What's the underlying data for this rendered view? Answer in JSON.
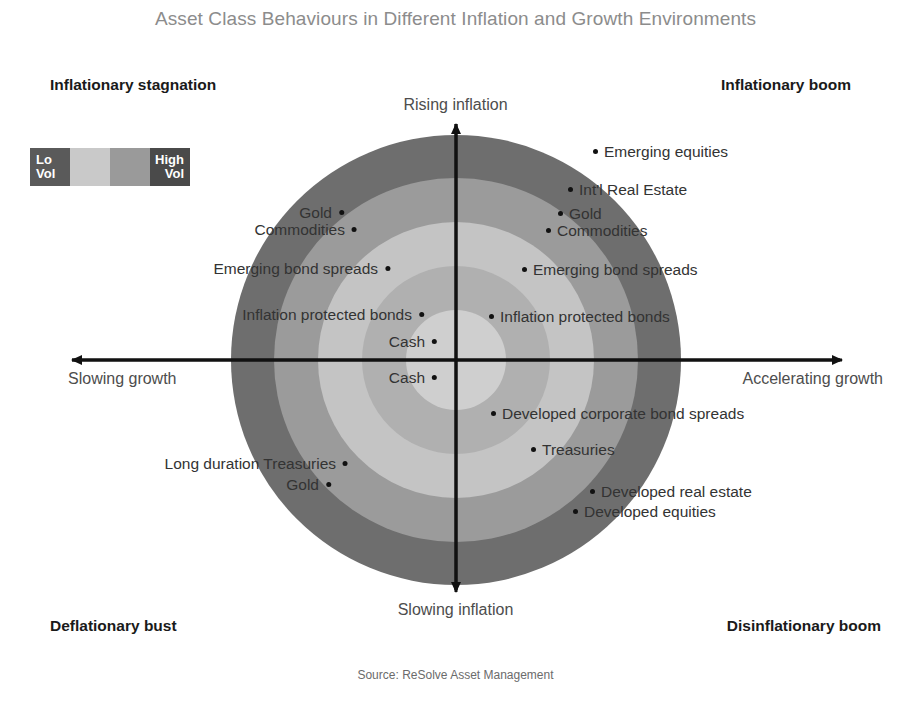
{
  "title": "Asset Class Behaviours in Different Inflation and Growth Environments",
  "source": "Source: ReSolve Asset Management",
  "quadrants": {
    "top_left": "Inflationary stagnation",
    "top_right": "Inflationary boom",
    "bottom_left": "Deflationary bust",
    "bottom_right": "Disinflationary boom"
  },
  "axes": {
    "top": "Rising inflation",
    "bottom": "Slowing inflation",
    "left": "Slowing growth",
    "right": "Accelerating growth"
  },
  "legend": {
    "low_label": "Lo\nVol",
    "low_label_line1": "Lo",
    "low_label_line2": "Vol",
    "high_label_line1": "High",
    "high_label_line2": "Vol",
    "bands": [
      "#5a5a5a",
      "#c9c9c9",
      "#9a9a9a",
      "#4a4a4a"
    ]
  },
  "colors": {
    "ring_outer": "#6e6e6e",
    "ring_2": "#9b9b9b",
    "ring_3": "#c4c4c4",
    "ring_4": "#b0b0b0",
    "ring_center": "#cfcfcf",
    "axis": "#111111",
    "title": "#8c8c8c",
    "label": "#333333"
  },
  "chart_data": {
    "type": "scatter",
    "title": "Asset Class Behaviours in Different Inflation and Growth Environments",
    "xlabel": "Growth",
    "ylabel": "Inflation",
    "xlim": [
      -1,
      1
    ],
    "ylim": [
      -1,
      1
    ],
    "grid": false,
    "legend": "Lo Vol to High Vol concentric volatility rings",
    "annotations": [
      "Inflationary stagnation",
      "Inflationary boom",
      "Deflationary bust",
      "Disinflationary boom"
    ],
    "points": [
      {
        "label": "Emerging equities",
        "x": 593,
        "y": 152,
        "side": "right"
      },
      {
        "label": "Int'l Real Estate",
        "x": 568,
        "y": 190,
        "side": "right"
      },
      {
        "label": "Gold",
        "x": 558,
        "y": 214,
        "side": "right"
      },
      {
        "label": "Commodities",
        "x": 546,
        "y": 231,
        "side": "right"
      },
      {
        "label": "Emerging bond spreads",
        "x": 522,
        "y": 270,
        "side": "right"
      },
      {
        "label": "Inflation protected bonds",
        "x": 489,
        "y": 317,
        "side": "right"
      },
      {
        "label": "Cash",
        "x": 437,
        "y": 342,
        "side": "left"
      },
      {
        "label": "Cash",
        "x": 437,
        "y": 378,
        "side": "left"
      },
      {
        "label": "Developed corporate bond spreads",
        "x": 491,
        "y": 414,
        "side": "right"
      },
      {
        "label": "Treasuries",
        "x": 531,
        "y": 450,
        "side": "right"
      },
      {
        "label": "Developed real estate",
        "x": 590,
        "y": 492,
        "side": "right"
      },
      {
        "label": "Developed equities",
        "x": 573,
        "y": 512,
        "side": "right"
      },
      {
        "label": "Gold",
        "x": 344,
        "y": 213,
        "side": "left"
      },
      {
        "label": "Commodities",
        "x": 357,
        "y": 230,
        "side": "left"
      },
      {
        "label": "Emerging bond spreads",
        "x": 390,
        "y": 269,
        "side": "left"
      },
      {
        "label": "Inflation protected bonds",
        "x": 424,
        "y": 315,
        "side": "left"
      },
      {
        "label": "Long duration Treasuries",
        "x": 348,
        "y": 464,
        "side": "left"
      },
      {
        "label": "Gold",
        "x": 331,
        "y": 485,
        "side": "left"
      }
    ]
  }
}
